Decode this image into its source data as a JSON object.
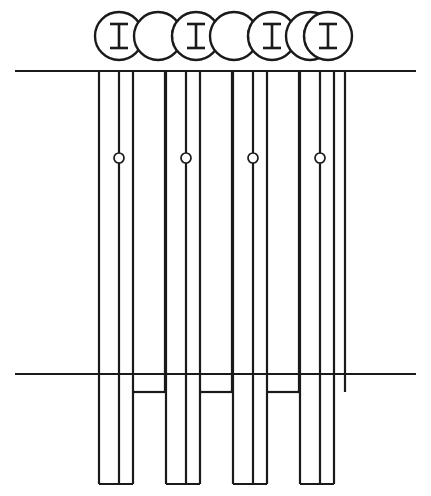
{
  "drawing": {
    "title": "Sheet Pile Wall Section",
    "view_plan_label": "plan view of interlocked pile sections",
    "view_elevation_label": "elevation of pile wall",
    "stroke_color": "#1a1a1a",
    "background_color": "#ffffff",
    "canvas": {
      "width": 431,
      "height": 496
    }
  },
  "plan_view": {
    "name": "interlocked-pile-row",
    "circle_radius": 24,
    "circle_center_y": 36,
    "circles": [
      {
        "id": "pile-1",
        "cx": 119,
        "type": "ibeam",
        "has_ibeam": true,
        "dash_side": "right"
      },
      {
        "id": "pile-2",
        "cx": 158,
        "type": "plain",
        "has_ibeam": false,
        "dash_side": "none"
      },
      {
        "id": "pile-3",
        "cx": 196,
        "type": "ibeam",
        "has_ibeam": true,
        "dash_side": "both"
      },
      {
        "id": "pile-4",
        "cx": 234,
        "type": "plain",
        "has_ibeam": false,
        "dash_side": "none"
      },
      {
        "id": "pile-5",
        "cx": 272,
        "type": "ibeam",
        "has_ibeam": true,
        "dash_side": "both"
      },
      {
        "id": "pile-6",
        "cx": 310,
        "type": "plain",
        "has_ibeam": false,
        "dash_side": "none"
      },
      {
        "id": "pile-7",
        "cx": 328,
        "type": "ibeam",
        "has_ibeam": true,
        "dash_side": "left"
      }
    ],
    "ibeam_profile": {
      "flange_half_width": 9,
      "half_height": 12,
      "web_thickness": 2.6
    }
  },
  "elevation_view": {
    "name": "pile-wall-elevation",
    "top_reference_line": {
      "id": "upper-ground-line",
      "x1": 15,
      "x2": 416,
      "y": 71
    },
    "bottom_reference_line": {
      "id": "lower-ground-line",
      "x1": 15,
      "x2": 416,
      "y": 374
    },
    "pile_group_pitch": 67,
    "pile_groups": [
      {
        "id": "pile-group-1",
        "left_x": 99,
        "web_x": 119,
        "right_x": 133,
        "outer_x": 165,
        "top_y": 71,
        "bottom_y": 484,
        "bolt": {
          "cx": 119,
          "cy": 158,
          "r": 5
        },
        "has_connector": true,
        "connector_y": 392
      },
      {
        "id": "pile-group-2",
        "left_x": 166,
        "web_x": 186,
        "right_x": 200,
        "outer_x": 232,
        "top_y": 71,
        "bottom_y": 484,
        "bolt": {
          "cx": 186,
          "cy": 158,
          "r": 5
        },
        "has_connector": true,
        "connector_y": 392
      },
      {
        "id": "pile-group-3",
        "left_x": 233,
        "web_x": 253,
        "right_x": 267,
        "outer_x": 299,
        "top_y": 71,
        "bottom_y": 484,
        "bolt": {
          "cx": 253,
          "cy": 158,
          "r": 5
        },
        "has_connector": true,
        "connector_y": 392
      },
      {
        "id": "pile-group-4",
        "left_x": 300,
        "web_x": 320,
        "right_x": 334,
        "outer_x": 345,
        "top_y": 71,
        "bottom_y": 484,
        "bolt": {
          "cx": 320,
          "cy": 158,
          "r": 5
        },
        "has_connector": false,
        "connector_y": 392
      }
    ]
  }
}
